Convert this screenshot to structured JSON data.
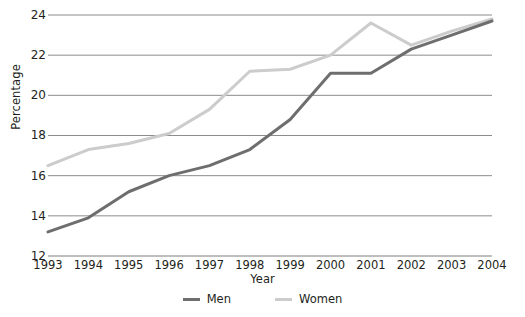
{
  "chart_data": {
    "type": "line",
    "title": "",
    "xlabel": "Year",
    "ylabel": "Percentage",
    "categories": [
      "1993",
      "1994",
      "1995",
      "1996",
      "1997",
      "1998",
      "1999",
      "2000",
      "2001",
      "2002",
      "2003",
      "2004"
    ],
    "xlim": [
      1993,
      2004
    ],
    "ylim": [
      12,
      24
    ],
    "yticks": [
      12,
      14,
      16,
      18,
      20,
      22,
      24
    ],
    "grid": "horizontal",
    "legend_position": "bottom",
    "series": [
      {
        "name": "Men",
        "color": "#6e6e6e",
        "values": [
          13.2,
          13.9,
          15.2,
          16.0,
          16.5,
          17.3,
          18.8,
          21.1,
          21.1,
          22.3,
          23.0,
          23.7
        ]
      },
      {
        "name": "Women",
        "color": "#cccccc",
        "values": [
          16.5,
          17.3,
          17.6,
          18.1,
          19.3,
          21.2,
          21.3,
          22.0,
          23.6,
          22.5,
          23.2,
          23.8
        ]
      }
    ]
  },
  "axis": {
    "y_title": "Percentage",
    "x_title": "Year",
    "y_tick_labels": [
      "24",
      "22",
      "20",
      "18",
      "16",
      "14",
      "12"
    ],
    "x_tick_labels": [
      "1993",
      "1994",
      "1995",
      "1996",
      "1997",
      "1998",
      "1999",
      "2000",
      "2001",
      "2002",
      "2003",
      "2004"
    ]
  },
  "legend": {
    "items": [
      {
        "label": "Men",
        "color": "#6e6e6e"
      },
      {
        "label": "Women",
        "color": "#cccccc"
      }
    ]
  },
  "colors": {
    "men_line": "#6e6e6e",
    "women_line": "#cccccc",
    "gridline": "#7f7f7f",
    "text": "#231f20",
    "background": "#ffffff"
  }
}
